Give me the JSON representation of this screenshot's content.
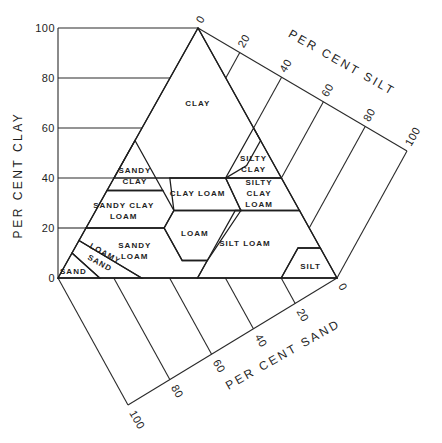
{
  "diagram": {
    "axes": {
      "clay": {
        "title": "PER CENT CLAY",
        "ticks": [
          "0",
          "20",
          "40",
          "60",
          "80",
          "100"
        ]
      },
      "silt": {
        "title": "PER CENT SILT",
        "ticks": [
          "0",
          "20",
          "40",
          "60",
          "80",
          "100"
        ]
      },
      "sand": {
        "title": "PER CENT SAND",
        "ticks": [
          "0",
          "20",
          "40",
          "60",
          "80",
          "100"
        ]
      }
    },
    "regions": [
      {
        "name": "clay",
        "label": [
          "CLAY"
        ],
        "polygon": [
          [
            100,
            0,
            0
          ],
          [
            40,
            0,
            60
          ],
          [
            40,
            40,
            20
          ],
          [
            45,
            45,
            10
          ],
          [
            55,
            45,
            0
          ],
          [
            60,
            40,
            0
          ]
        ],
        "label_at": [
          70,
          15,
          15
        ]
      },
      {
        "name": "sandy-clay",
        "label": [
          "SANDY",
          "CLAY"
        ],
        "polygon": [
          [
            35,
            0,
            65
          ],
          [
            55,
            0,
            45
          ],
          [
            35,
            20,
            45
          ]
        ],
        "label_at": [
          41,
          7,
          52
        ]
      },
      {
        "name": "silty-clay",
        "label": [
          "SILTY",
          "CLAY"
        ],
        "polygon": [
          [
            40,
            60,
            0
          ],
          [
            60,
            40,
            0
          ],
          [
            40,
            40,
            20
          ]
        ],
        "label_at": [
          46,
          47,
          7
        ]
      },
      {
        "name": "clay-loam",
        "label": [
          "CLAY LOAM"
        ],
        "polygon": [
          [
            40,
            20,
            40
          ],
          [
            40,
            40,
            20
          ],
          [
            27,
            52,
            21
          ],
          [
            27,
            28,
            45
          ]
        ],
        "label_at": [
          34,
          33,
          33
        ]
      },
      {
        "name": "silty-clay-loam",
        "label": [
          "SILTY",
          "CLAY",
          "LOAM"
        ],
        "polygon": [
          [
            40,
            60,
            0
          ],
          [
            40,
            40,
            20
          ],
          [
            27,
            52,
            21
          ],
          [
            27,
            73,
            0
          ]
        ],
        "label_at": [
          34,
          55,
          11
        ]
      },
      {
        "name": "sandy-clay-loam",
        "label": [
          "SANDY CLAY",
          "LOAM"
        ],
        "polygon": [
          [
            20,
            0,
            80
          ],
          [
            35,
            0,
            65
          ],
          [
            35,
            20,
            45
          ],
          [
            27,
            28,
            45
          ],
          [
            20,
            28,
            52
          ]
        ],
        "label_at": [
          27,
          10,
          63
        ]
      },
      {
        "name": "loam",
        "label": [
          "LOAM"
        ],
        "polygon": [
          [
            27,
            28,
            45
          ],
          [
            27,
            52,
            21
          ],
          [
            7,
            50,
            43
          ],
          [
            7,
            41,
            52
          ],
          [
            20,
            28,
            52
          ]
        ],
        "label_at": [
          18,
          40,
          42
        ]
      },
      {
        "name": "sandy-loam",
        "label": [
          "SANDY",
          "LOAM"
        ],
        "polygon": [
          [
            20,
            0,
            80
          ],
          [
            20,
            28,
            52
          ],
          [
            7,
            41,
            52
          ],
          [
            7,
            50,
            43
          ],
          [
            0,
            50,
            50
          ],
          [
            0,
            30,
            70
          ],
          [
            15,
            0,
            85
          ]
        ],
        "label_at": [
          11,
          22,
          67
        ]
      },
      {
        "name": "silt-loam",
        "label": [
          "SILT LOAM"
        ],
        "polygon": [
          [
            27,
            50,
            23
          ],
          [
            27,
            73,
            0
          ],
          [
            12,
            88,
            0
          ],
          [
            12,
            80,
            8
          ],
          [
            0,
            80,
            20
          ],
          [
            0,
            50,
            50
          ],
          [
            7,
            50,
            43
          ]
        ],
        "label_at": [
          14,
          60,
          26
        ]
      },
      {
        "name": "silt",
        "label": [
          "SILT"
        ],
        "polygon": [
          [
            12,
            88,
            0
          ],
          [
            12,
            80,
            8
          ],
          [
            0,
            80,
            20
          ],
          [
            0,
            100,
            0
          ]
        ],
        "label_at": [
          5,
          88,
          7
        ]
      },
      {
        "name": "loamy-sand",
        "label": [
          "LOAMY",
          "SAND"
        ],
        "polygon": [
          [
            15,
            0,
            85
          ],
          [
            0,
            30,
            70
          ],
          [
            0,
            15,
            85
          ],
          [
            10,
            0,
            90
          ]
        ],
        "label_at": [
          8,
          12,
          80
        ]
      },
      {
        "name": "sand",
        "label": [
          "SAND"
        ],
        "polygon": [
          [
            10,
            0,
            90
          ],
          [
            0,
            15,
            85
          ],
          [
            0,
            0,
            100
          ]
        ],
        "label_at": [
          3,
          4,
          93
        ]
      }
    ]
  },
  "chart_data": {
    "type": "ternary",
    "title": "",
    "axes": [
      "PER CENT CLAY",
      "PER CENT SILT",
      "PER CENT SAND"
    ],
    "ticks": [
      0,
      20,
      40,
      60,
      80,
      100
    ],
    "classes": [
      "CLAY",
      "SANDY CLAY",
      "SILTY CLAY",
      "CLAY LOAM",
      "SILTY CLAY LOAM",
      "SANDY CLAY LOAM",
      "LOAM",
      "SANDY LOAM",
      "SILT LOAM",
      "SILT",
      "LOAMY SAND",
      "SAND"
    ],
    "grid": true
  }
}
